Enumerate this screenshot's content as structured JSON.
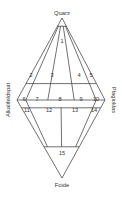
{
  "diagram": {
    "type": "QAPF double ternary (Streckeisen)",
    "apices": {
      "top": "Quarz",
      "left": "Alkalifeldspat",
      "right": "Plagioklas",
      "bottom": "Foide"
    },
    "fields": [
      {
        "id": "1",
        "label": "1"
      },
      {
        "id": "2",
        "label": "2"
      },
      {
        "id": "3",
        "label": "3"
      },
      {
        "id": "4",
        "label": "4"
      },
      {
        "id": "5",
        "label": "5"
      },
      {
        "id": "6",
        "label": "6"
      },
      {
        "id": "7",
        "label": "7"
      },
      {
        "id": "8",
        "label": "8"
      },
      {
        "id": "9",
        "label": "9"
      },
      {
        "id": "10",
        "label": "10"
      },
      {
        "id": "11",
        "label": "11"
      },
      {
        "id": "12",
        "label": "12"
      },
      {
        "id": "13",
        "label": "13"
      },
      {
        "id": "14",
        "label": "14"
      },
      {
        "id": "15",
        "label": "15"
      }
    ],
    "boundaries": {
      "upper_Q_levels_percent": [
        90,
        20,
        5
      ],
      "lower_F_levels_percent": [
        10,
        60
      ],
      "plag_ratio_divisions_percent": [
        10,
        35,
        65,
        90
      ]
    }
  }
}
